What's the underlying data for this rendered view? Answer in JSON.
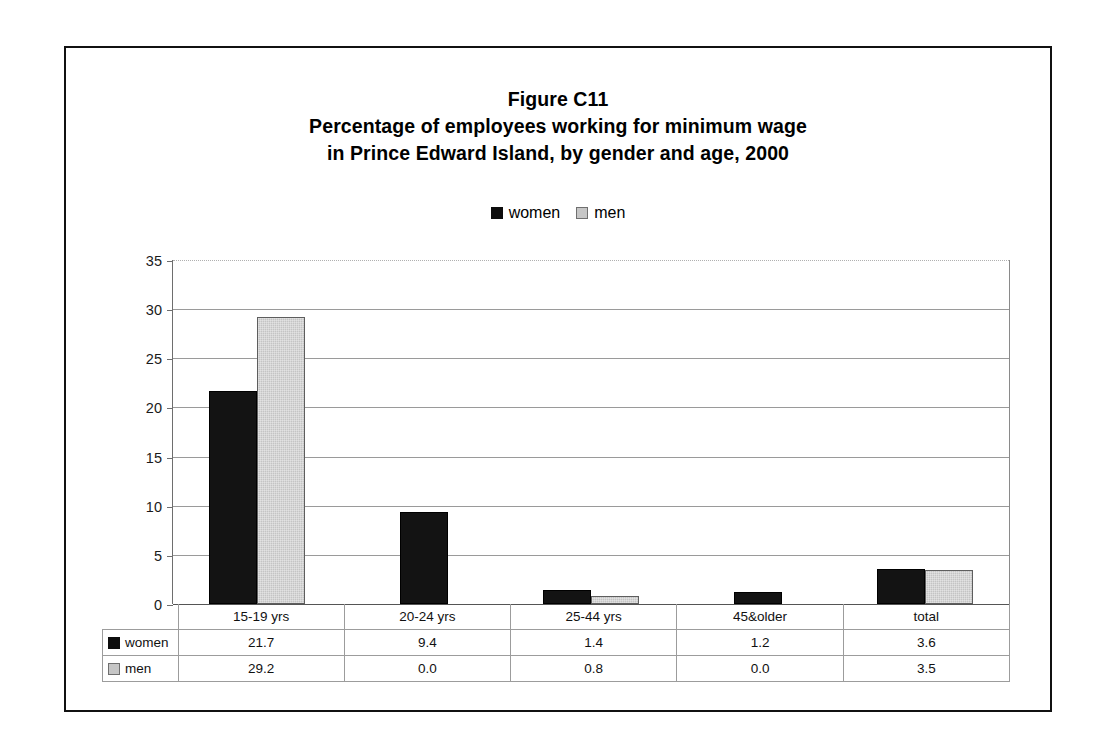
{
  "figure": {
    "title_lines": [
      "Figure C11",
      "Percentage of employees working for minimum wage",
      "in Prince Edward Island, by gender and age, 2000"
    ]
  },
  "legend": {
    "items": [
      {
        "label": "women",
        "color": "#131313",
        "icon": "square-filled-black"
      },
      {
        "label": "men",
        "color": "#c4c4c4",
        "icon": "square-filled-gray"
      }
    ]
  },
  "chart_data": {
    "type": "bar",
    "xlabel": "",
    "ylabel": "",
    "ylim": [
      0,
      35
    ],
    "yticks": [
      0,
      5,
      10,
      15,
      20,
      25,
      30,
      35
    ],
    "ytick_labels": [
      "0",
      "5",
      "10",
      "15",
      "20",
      "25",
      "30",
      "35"
    ],
    "grid": true,
    "legend_position": "top-center",
    "categories": [
      "15-19 yrs",
      "20-24 yrs",
      "25-44 yrs",
      "45&older",
      "total"
    ],
    "series": [
      {
        "name": "women",
        "color": "#131313",
        "values": [
          21.7,
          9.4,
          1.4,
          1.2,
          3.6
        ]
      },
      {
        "name": "men",
        "color": "#c4c4c4",
        "values": [
          29.2,
          0.0,
          0.8,
          0.0,
          3.5
        ]
      }
    ]
  },
  "table": {
    "category_row": [
      "15-19 yrs",
      "20-24 yrs",
      "25-44 yrs",
      "45&older",
      "total"
    ],
    "rows": [
      {
        "label": "women",
        "swatch": "#131313",
        "values": [
          "21.7",
          "9.4",
          "1.4",
          "1.2",
          "3.6"
        ]
      },
      {
        "label": "men",
        "swatch": "#c4c4c4",
        "values": [
          "29.2",
          "0.0",
          "0.8",
          "0.0",
          "3.5"
        ]
      }
    ]
  },
  "axis": {
    "labels": [
      "35",
      "30",
      "25",
      "20",
      "15",
      "10",
      "5",
      "0"
    ]
  }
}
